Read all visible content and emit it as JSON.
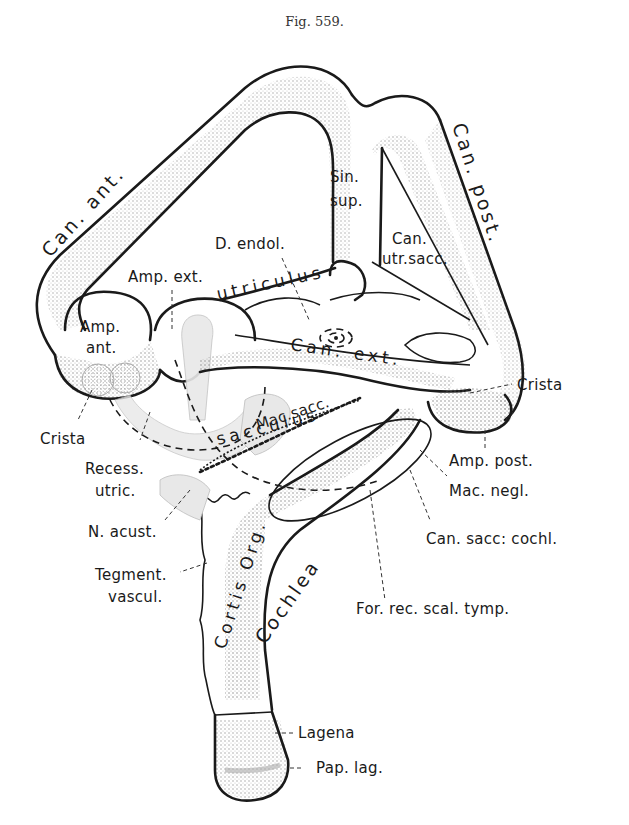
{
  "figure": {
    "title": "Fig. 559."
  },
  "labels": {
    "can_ant": "Can. ant.",
    "can_post": "Can. post.",
    "sin_sup_1": "Sin.",
    "sin_sup_2": "sup.",
    "d_endol": "D. endol.",
    "can_utrsacc_1": "Can.",
    "can_utrsacc_2": "utr.sacc.",
    "amp_ext": "Amp. ext.",
    "utriculus": "utriculus",
    "amp_ant_1": "Amp.",
    "amp_ant_2": "ant.",
    "can_ext": "Can. ext.",
    "crista_left": "Crista",
    "crista_right": "Crista",
    "mac_sacc": "Mac.sacc.",
    "sacculus": "sacculus",
    "recess_utric_1": "Recess.",
    "recess_utric_2": "utric.",
    "amp_post": "Amp. post.",
    "mac_negl": "Mac. negl.",
    "n_acust": "N. acust.",
    "can_sacc_cochl": "Can. sacc: cochl.",
    "cortis_org": "Cortis Org.",
    "cochlea": "Cochlea",
    "tegment_vascul_1": "Tegment.",
    "tegment_vascul_2": "vascul.",
    "for_rec_scal_tymp": "For. rec. scal. tymp.",
    "lagena": "Lagena",
    "pap_lag": "Pap. lag."
  },
  "colors": {
    "ink": "#1a1a1a",
    "paper": "#ffffff",
    "stipple": "#555555",
    "fiber_gray": "#bdbdbd"
  }
}
